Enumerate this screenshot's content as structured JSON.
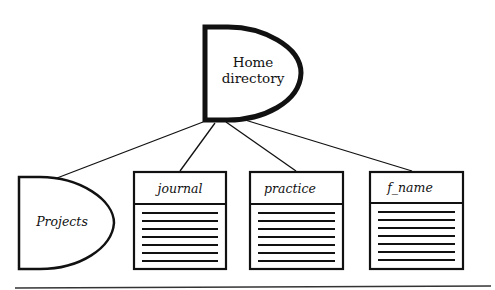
{
  "diagram": {
    "type": "directory-tree",
    "root": {
      "label_line1": "Home",
      "label_line2": "directory",
      "shape": "d-shape-directory"
    },
    "children": [
      {
        "label": "Projects",
        "shape": "d-shape-directory"
      },
      {
        "label": "journal",
        "shape": "file"
      },
      {
        "label": "practice",
        "shape": "file"
      },
      {
        "label": "f_name",
        "shape": "file"
      }
    ],
    "colors": {
      "stroke": "#111111",
      "background": "#ffffff"
    }
  }
}
